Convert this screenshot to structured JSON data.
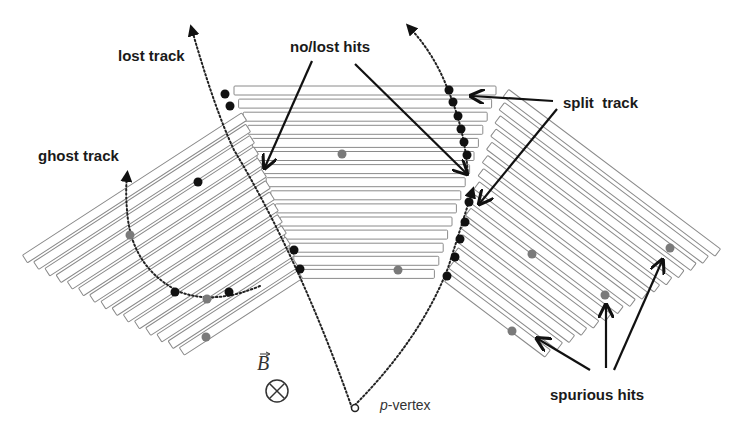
{
  "diagram": {
    "type": "particle tracking detector schematic",
    "labels": {
      "lost_track": "lost track",
      "no_lost_hits": "no/lost hits",
      "split_track": "split  track",
      "ghost_track": "ghost track",
      "spurious_hits": "spurious hits",
      "p_vertex_italic": "p",
      "p_vertex_rest": "-vertex",
      "b_field": "B"
    },
    "colors": {
      "strip_stroke": "#8a8a8a",
      "hit_real": "#111111",
      "hit_spurious": "#7a7a7a",
      "track": "#222222",
      "arrow": "#111111"
    },
    "detector_stacks": [
      {
        "name": "left-stack",
        "strip_count": 15,
        "orientation": "tilted up-right"
      },
      {
        "name": "center-stack",
        "strip_count": 15,
        "orientation": "horizontal"
      },
      {
        "name": "right-stack",
        "strip_count": 15,
        "orientation": "tilted down-right"
      }
    ],
    "symbols": {
      "b_field_direction": "into page (⊗)"
    }
  }
}
